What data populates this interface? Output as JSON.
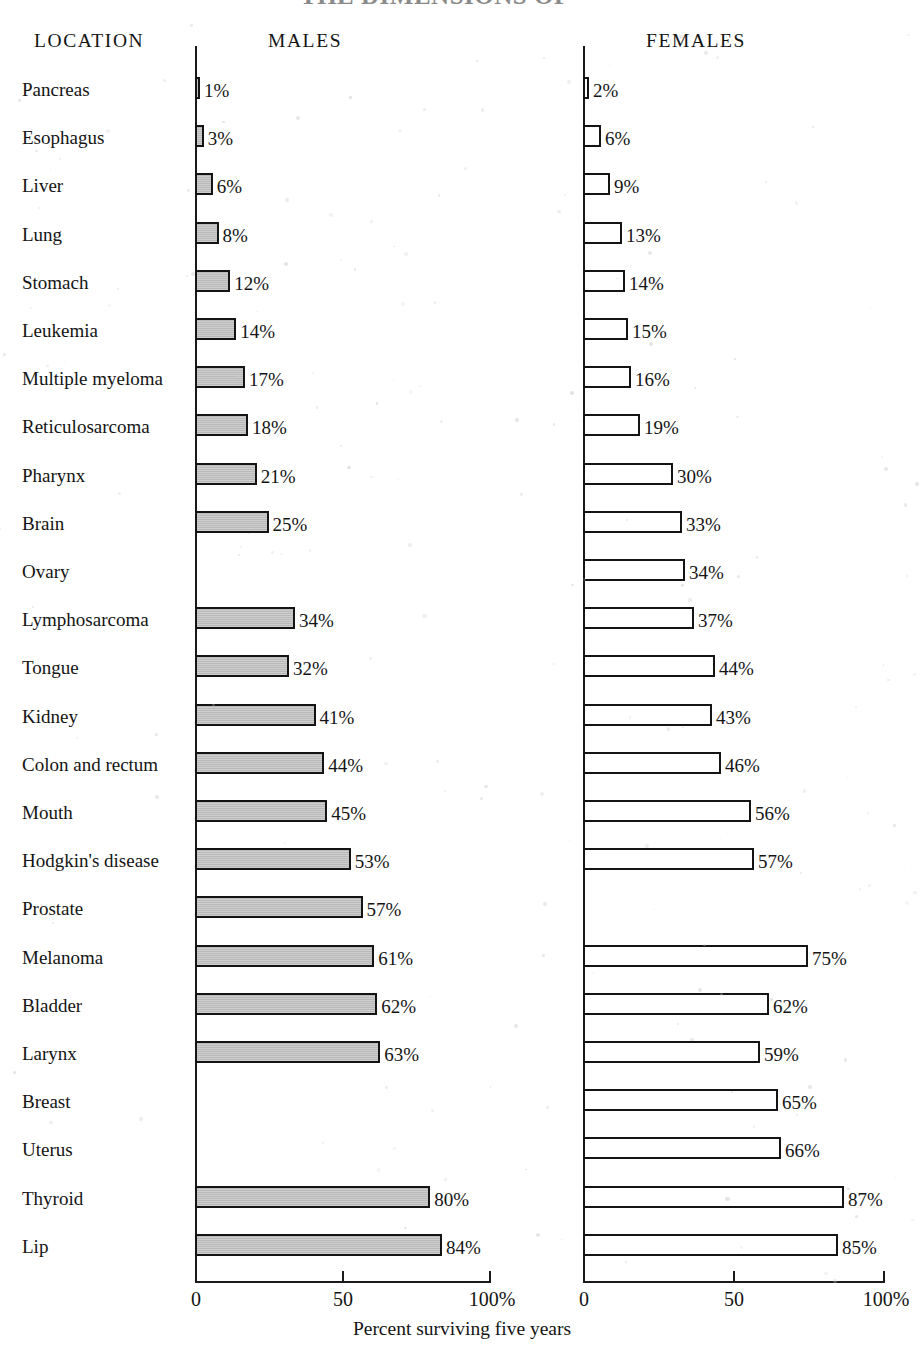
{
  "title_partial": "THE DIMENSIONS OF",
  "headers": {
    "location": "LOCATION",
    "males": "MALES",
    "females": "FEMALES"
  },
  "axis": {
    "ticks": [
      "0",
      "50",
      "100%"
    ],
    "caption": "Percent surviving five years",
    "range": [
      0,
      100
    ]
  },
  "colors": {
    "male_bar_fill": "#b9b9b9",
    "female_bar_fill": "#ffffff",
    "bar_border": "#141414",
    "text": "#141414",
    "background": "#ffffff"
  },
  "chart_data": {
    "type": "bar",
    "title": "THE DIMENSIONS OF",
    "xlabel": "Percent surviving five years",
    "ylabel": "LOCATION",
    "xlim": [
      0,
      100
    ],
    "grid": false,
    "legend": "none",
    "orientation": "horizontal",
    "panels": [
      "MALES",
      "FEMALES"
    ],
    "categories": [
      "Pancreas",
      "Esophagus",
      "Liver",
      "Lung",
      "Stomach",
      "Leukemia",
      "Multiple myeloma",
      "Reticulosarcoma",
      "Pharynx",
      "Brain",
      "Ovary",
      "Lymphosarcoma",
      "Tongue",
      "Kidney",
      "Colon and rectum",
      "Mouth",
      "Hodgkin's disease",
      "Prostate",
      "Melanoma",
      "Bladder",
      "Larynx",
      "Breast",
      "Uterus",
      "Thyroid",
      "Lip"
    ],
    "series": [
      {
        "name": "MALES",
        "values": [
          1,
          3,
          6,
          8,
          12,
          14,
          17,
          18,
          21,
          25,
          null,
          34,
          32,
          41,
          44,
          45,
          53,
          57,
          61,
          62,
          63,
          null,
          null,
          80,
          84
        ],
        "labels": [
          "1%",
          "3%",
          "6%",
          "8%",
          "12%",
          "14%",
          "17%",
          "18%",
          "21%",
          "25%",
          "",
          "34%",
          "32%",
          "41%",
          "44%",
          "45%",
          "53%",
          "57%",
          "61%",
          "62%",
          "63%",
          "",
          "",
          "80%",
          "84%"
        ]
      },
      {
        "name": "FEMALES",
        "values": [
          2,
          6,
          9,
          13,
          14,
          15,
          16,
          19,
          30,
          33,
          34,
          37,
          44,
          43,
          46,
          56,
          57,
          null,
          75,
          62,
          59,
          65,
          66,
          87,
          85
        ],
        "labels": [
          "2%",
          "6%",
          "9%",
          "13%",
          "14%",
          "15%",
          "16%",
          "19%",
          "30%",
          "33%",
          "34%",
          "37%",
          "44%",
          "43%",
          "46%",
          "56%",
          "57%",
          "",
          "75%",
          "62%",
          "59%",
          "65%",
          "66%",
          "87%",
          "85%"
        ]
      }
    ]
  }
}
